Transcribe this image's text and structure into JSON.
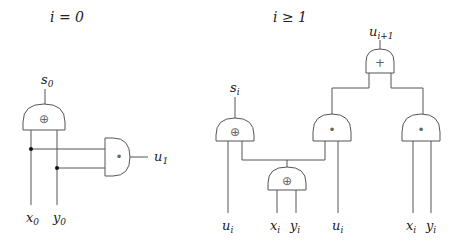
{
  "panels": {
    "base": {
      "title": "i = 0",
      "gates": {
        "xor": {
          "type": "xor",
          "symbol": "⊕",
          "output_var": "s",
          "output_sub": "0"
        },
        "and": {
          "type": "and",
          "symbol": "•",
          "output_var": "u",
          "output_sub": "1"
        }
      },
      "inputs": [
        {
          "var": "x",
          "sub": "0"
        },
        {
          "var": "y",
          "sub": "0"
        }
      ]
    },
    "step": {
      "title": "i ≥ 1",
      "gates": {
        "sum_xor": {
          "type": "xor",
          "symbol": "⊕",
          "output_var": "s",
          "output_sub": "i"
        },
        "inner_xor": {
          "type": "xor",
          "symbol": "⊕"
        },
        "carry_and": {
          "type": "and",
          "symbol": "•"
        },
        "input_and": {
          "type": "and",
          "symbol": "•"
        },
        "or_gate": {
          "type": "or",
          "symbol": "+",
          "output_var": "u",
          "output_sub": "i+1"
        }
      },
      "inputs": [
        {
          "var": "u",
          "sub": "i"
        },
        {
          "var": "x",
          "sub": "i"
        },
        {
          "var": "y",
          "sub": "i"
        },
        {
          "var": "u",
          "sub": "i"
        },
        {
          "var": "x",
          "sub": "i"
        },
        {
          "var": "y",
          "sub": "i"
        }
      ]
    }
  }
}
